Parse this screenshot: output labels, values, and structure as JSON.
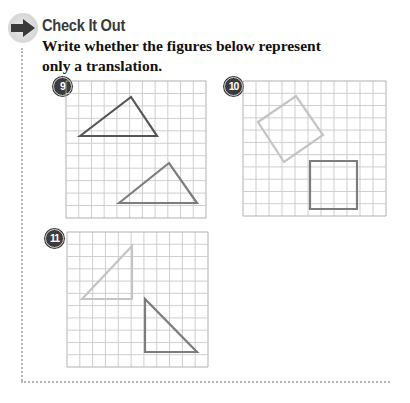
{
  "section": {
    "heading": "Check It Out",
    "instructions": "Write whether the figures below represent only a translation."
  },
  "colors": {
    "grid_line": "#c9c9c9",
    "grid_border": "#a8a8a8",
    "dark_shape": "#555555",
    "mid_shape": "#7d7d7d",
    "light_shape": "#c4c4c4",
    "badge": "#3b3b3b",
    "dotted_border": "#b5b5b5"
  },
  "problems": [
    {
      "number": "9",
      "description": "Two triangles on a grid; one in upper-left, one in lower-right, same orientation",
      "grid": {
        "x": 66,
        "y": 81,
        "width": 140,
        "height": 137,
        "cols": 11,
        "rows": 11
      },
      "shapes": [
        {
          "type": "triangle",
          "tone": "dark",
          "points": [
            [
              80,
              136
            ],
            [
              131,
              97
            ],
            [
              157,
              136
            ]
          ]
        },
        {
          "type": "triangle",
          "tone": "mid",
          "points": [
            [
              119,
              203
            ],
            [
              169,
              163
            ],
            [
              197,
              203
            ]
          ]
        }
      ]
    },
    {
      "number": "10",
      "description": "A tilted square and an upright square on a grid",
      "grid": {
        "x": 243,
        "y": 81,
        "width": 143,
        "height": 135,
        "cols": 11,
        "rows": 11
      },
      "shapes": [
        {
          "type": "square",
          "tone": "light",
          "points": [
            [
              258,
              122
            ],
            [
              296,
              96
            ],
            [
              323,
              135
            ],
            [
              284,
              162
            ]
          ]
        },
        {
          "type": "square",
          "tone": "mid",
          "points": [
            [
              310,
              161
            ],
            [
              357,
              161
            ],
            [
              357,
              209
            ],
            [
              310,
              209
            ]
          ]
        }
      ]
    },
    {
      "number": "11",
      "description": "Two right triangles on a grid with different orientations",
      "grid": {
        "x": 67,
        "y": 232,
        "width": 141,
        "height": 135,
        "cols": 11,
        "rows": 11
      },
      "shapes": [
        {
          "type": "triangle",
          "tone": "light",
          "points": [
            [
              82,
              299
            ],
            [
              132,
              246
            ],
            [
              132,
              299
            ]
          ]
        },
        {
          "type": "triangle",
          "tone": "mid",
          "points": [
            [
              145,
              299
            ],
            [
              145,
              352
            ],
            [
              197,
              352
            ]
          ]
        }
      ]
    }
  ]
}
